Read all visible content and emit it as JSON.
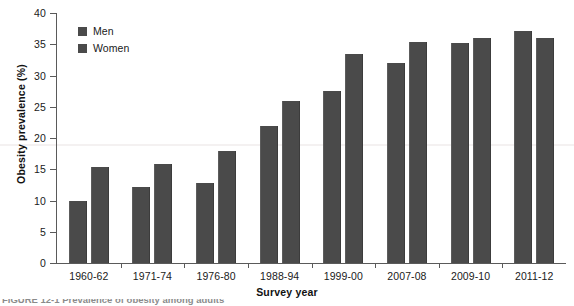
{
  "chart_data": {
    "type": "bar",
    "title": "",
    "subtitle": "",
    "xlabel": "Survey year",
    "ylabel": "Obesity prevalence (%)",
    "ylim": [
      0,
      40
    ],
    "yticks": [
      0,
      5,
      10,
      15,
      20,
      25,
      30,
      35,
      40
    ],
    "ytick_labels": [
      "0",
      "5",
      "10",
      "15",
      "20",
      "25",
      "30",
      "35",
      "40"
    ],
    "grid": false,
    "legend_position": "top-left",
    "categories": [
      "1960-62",
      "1971-74",
      "1976-80",
      "1988-94",
      "1999-00",
      "2007-08",
      "2009-10",
      "2011-12"
    ],
    "series": [
      {
        "name": "Men",
        "color": "#4a4a4a",
        "values": [
          10.0,
          12.1,
          12.8,
          21.9,
          27.5,
          32.0,
          35.2,
          37.2
        ]
      },
      {
        "name": "Women",
        "color": "#4a4a4a",
        "values": [
          15.4,
          15.9,
          17.9,
          26.0,
          33.5,
          35.3,
          36.0,
          36.0
        ]
      }
    ]
  },
  "legend": {
    "items": [
      {
        "label": "Men",
        "color": "#4a4a4a"
      },
      {
        "label": "Women",
        "color": "#4a4a4a"
      }
    ]
  },
  "axes": {
    "y_title": "Obesity prevalence (%)",
    "x_title": "Survey year"
  },
  "caption": {
    "text": "FIGURE 12-1   Prevalence of obesity among adults"
  }
}
